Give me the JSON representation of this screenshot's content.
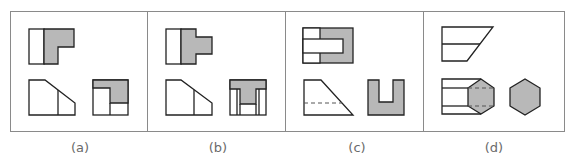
{
  "figure": {
    "colors": {
      "fill": "#b8b8b8",
      "stroke": "#222222",
      "frame": "#8a8a8a",
      "label": "#6a6a6a",
      "background": "#ffffff"
    },
    "panels": [
      {
        "id": "a",
        "label": "(a)",
        "description": "L-shaped block: top view, front view with chamfer, side view with shaded L"
      },
      {
        "id": "b",
        "label": "(b)",
        "description": "T-shaped block: top view with tab, front view with chamfer, side view with shaded T"
      },
      {
        "id": "c",
        "label": "(c)",
        "description": "Slotted wedge: top view with slot, front view with hidden line, side view U-shape"
      },
      {
        "id": "d",
        "label": "(d)",
        "description": "Hexagonal prism: top view parallelogram, front view with hexagon, end view hexagon"
      }
    ]
  }
}
